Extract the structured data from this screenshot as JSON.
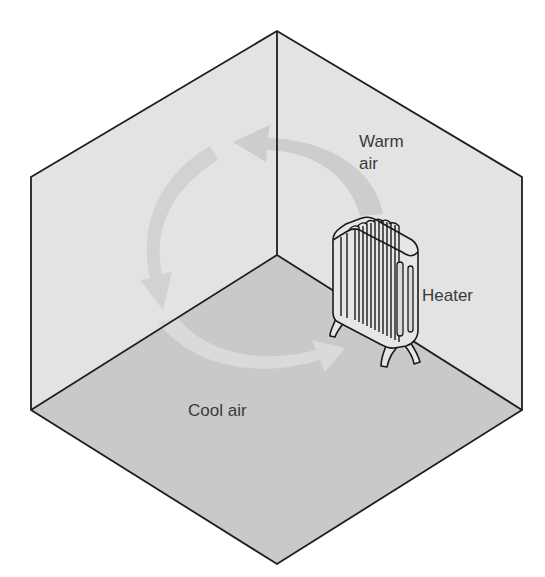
{
  "diagram": {
    "labels": {
      "warm_air_line1": "Warm",
      "warm_air_line2": "air",
      "heater": "Heater",
      "cool_air": "Cool air"
    },
    "colors": {
      "wall": "#e3e3e3",
      "floor": "#c9c9c9",
      "edge": "#1e1e1e",
      "arrow_wall": "#cdcdcd",
      "arrow_floor": "#d9d9d9",
      "heater_fill": "#e6e6e6",
      "heater_stroke": "#1a1a1a",
      "text": "#3a3a3a"
    },
    "elements": [
      {
        "name": "left-wall",
        "shape": "parallelogram"
      },
      {
        "name": "right-wall",
        "shape": "parallelogram"
      },
      {
        "name": "floor",
        "shape": "rhombus"
      },
      {
        "name": "warm-air-arrow",
        "direction": "from heater up and toward the left wall"
      },
      {
        "name": "descending-air-arrow",
        "direction": "down along the left wall"
      },
      {
        "name": "cool-air-arrow",
        "direction": "along floor back toward heater"
      },
      {
        "name": "heater",
        "type": "radiator"
      }
    ]
  }
}
